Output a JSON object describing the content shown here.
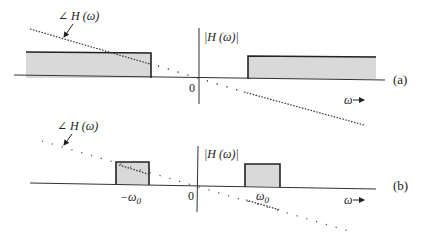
{
  "colors": {
    "axis": "#333333",
    "rect_fill": "#d9d9d9",
    "rect_stroke": "#222222",
    "phase": "#333333",
    "text": "#222222"
  },
  "panel_a": {
    "tag": "(a)",
    "magnitude_label": "|H (ω)|",
    "phase_label": "∠ H (ω)",
    "origin_label": "0",
    "omega_label": "ω",
    "arrow_glyph": "→"
  },
  "panel_b": {
    "tag": "(b)",
    "magnitude_label": "|H (ω)|",
    "phase_label": "∠ H (ω)",
    "origin_label": "0",
    "neg_omega0_label": "−ω",
    "pos_omega0_label": "ω",
    "omega0_subscript": "0",
    "omega_label": "ω",
    "arrow_glyph": "→"
  }
}
